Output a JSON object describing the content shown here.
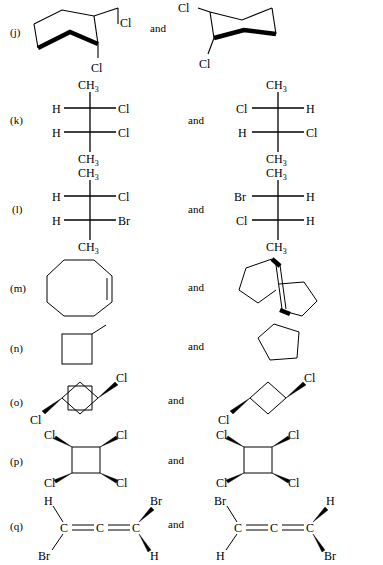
{
  "figure": {
    "kind": "organic-chemistry-stereochemistry-pairs",
    "background_color": "#ffffff",
    "ink_color": "#000000",
    "conjunction": "and"
  },
  "rows": [
    {
      "id": "j",
      "label": "(j)",
      "conjunction": "and",
      "left": {
        "type": "cyclohexane-chair",
        "substituents": [
          "Cl",
          "Cl"
        ],
        "labels": {
          "upper": "Cl",
          "lower": "Cl"
        }
      },
      "right": {
        "type": "cyclohexane-chair",
        "substituents": [
          "Cl",
          "Cl"
        ],
        "labels": {
          "upper": "Cl",
          "lower": "Cl"
        }
      }
    },
    {
      "id": "k",
      "label": "(k)",
      "conjunction": "and",
      "left": {
        "type": "fischer-projection",
        "top": "CH3",
        "bottom": "CH3",
        "centers": [
          {
            "left": "H",
            "right": "Cl"
          },
          {
            "left": "H",
            "right": "Cl"
          }
        ]
      },
      "right": {
        "type": "fischer-projection",
        "top": "CH3",
        "bottom": "CH3",
        "centers": [
          {
            "left": "Cl",
            "right": "H"
          },
          {
            "left": "H",
            "right": "Cl"
          }
        ]
      }
    },
    {
      "id": "l",
      "label": "(l)",
      "conjunction": "and",
      "left": {
        "type": "fischer-projection",
        "top": "CH3",
        "bottom": "CH3",
        "centers": [
          {
            "left": "H",
            "right": "Cl"
          },
          {
            "left": "H",
            "right": "Br"
          }
        ]
      },
      "right": {
        "type": "fischer-projection",
        "top": "CH3",
        "bottom": "CH3",
        "centers": [
          {
            "left": "Br",
            "right": "H"
          },
          {
            "left": "Cl",
            "right": "H"
          }
        ]
      }
    },
    {
      "id": "m",
      "label": "(m)",
      "conjunction": "and",
      "left": {
        "type": "cyclooctene",
        "ring_size": 8,
        "double_bonds": 1
      },
      "right": {
        "type": "bicyclic-alkene-spiro",
        "rings": [
          5,
          5
        ],
        "double_bonds": 1
      }
    },
    {
      "id": "n",
      "label": "(n)",
      "conjunction": "and",
      "left": {
        "type": "methylcyclobutane",
        "ring_size": 4,
        "substituents": [
          "CH3"
        ]
      },
      "right": {
        "type": "cyclopentane",
        "ring_size": 5,
        "substituents": []
      }
    },
    {
      "id": "o",
      "label": "(o)",
      "conjunction": "and",
      "left": {
        "type": "1,3-dichlorocyclobutane",
        "ring_size": 4,
        "labels": {
          "top_right": "Cl",
          "bottom_left": "Cl"
        },
        "bond_styles": {
          "top_right": "wedge",
          "bottom_left": "wedge"
        }
      },
      "right": {
        "type": "1,3-dichlorocyclobutane",
        "ring_size": 4,
        "labels": {
          "top_right": "Cl",
          "bottom_left": "Cl"
        },
        "bond_styles": {
          "top_right": "wedge",
          "bottom_left": "wedge"
        }
      }
    },
    {
      "id": "p",
      "label": "(p)",
      "conjunction": "and",
      "left": {
        "type": "tetrachlorocyclobutane",
        "ring_size": 4,
        "labels": {
          "top_left": "Cl",
          "top_right": "Cl",
          "bottom_left": "Cl",
          "bottom_right": "Cl"
        },
        "bond_styles": {
          "top_left": "wedge",
          "top_right": "wedge",
          "bottom_left": "wedge",
          "bottom_right": "wedge"
        }
      },
      "right": {
        "type": "tetrachlorocyclobutane",
        "ring_size": 4,
        "labels": {
          "top_left": "Cl",
          "top_right": "Cl",
          "bottom_left": "Cl",
          "bottom_right": "Cl"
        },
        "bond_styles": {
          "top_left": "wedge",
          "top_right": "wedge",
          "bottom_left": "wedge",
          "bottom_right": "wedge"
        }
      }
    },
    {
      "id": "q",
      "label": "(q)",
      "conjunction": "and",
      "left": {
        "type": "allene",
        "backbone": [
          "C",
          "C",
          "C"
        ],
        "bond_symbols": [
          "=",
          "="
        ],
        "labels": {
          "top_left": "H",
          "bottom_left": "Br",
          "top_right": "Br",
          "bottom_right": "H"
        },
        "bond_styles": {
          "top_left": "plain",
          "bottom_left": "plain",
          "top_right": "wedge",
          "bottom_right": "wedge"
        }
      },
      "right": {
        "type": "allene",
        "backbone": [
          "C",
          "C",
          "C"
        ],
        "bond_symbols": [
          "=",
          "="
        ],
        "labels": {
          "top_left": "Br",
          "bottom_left": "H",
          "top_right": "H",
          "bottom_right": "Br"
        },
        "bond_styles": {
          "top_left": "plain",
          "bottom_left": "plain",
          "top_right": "wedge",
          "bottom_right": "wedge"
        }
      }
    }
  ]
}
